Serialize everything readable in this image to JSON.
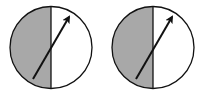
{
  "diagram": {
    "colors": {
      "shade": "#a8a8a8",
      "stroke": "#111111",
      "background": "#ffffff"
    },
    "circles": [
      {
        "id": "circle-1",
        "cx": 51,
        "cy": 47.5,
        "r": 41,
        "arrow": {
          "x1": 33,
          "y1": 79,
          "x2": 69,
          "y2": 17
        }
      },
      {
        "id": "circle-2",
        "cx": 153,
        "cy": 47.5,
        "r": 41,
        "arrow": {
          "x1": 136,
          "y1": 79,
          "x2": 172,
          "y2": 17
        }
      }
    ]
  }
}
